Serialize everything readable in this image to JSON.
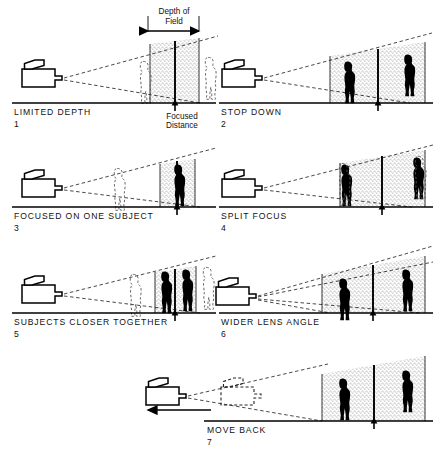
{
  "figure": {
    "background_color": "#ffffff",
    "ink_color": "#000000",
    "stipple_color": "#9a9a9a"
  },
  "annotations": {
    "depth_of_field_line1": "Depth of",
    "depth_of_field_line2": "Field",
    "focused_distance_line1": "Focused",
    "focused_distance_line2": "Distance"
  },
  "panels": [
    {
      "number": "1",
      "caption": "LIMITED DEPTH"
    },
    {
      "number": "2",
      "caption": "STOP DOWN"
    },
    {
      "number": "3",
      "caption": "FOCUSED ON ONE SUBJECT"
    },
    {
      "number": "4",
      "caption": "SPLIT FOCUS"
    },
    {
      "number": "5",
      "caption": "SUBJECTS CLOSER TOGETHER"
    },
    {
      "number": "6",
      "caption": "WIDER LENS ANGLE"
    },
    {
      "number": "7",
      "caption": "MOVE BACK"
    }
  ]
}
